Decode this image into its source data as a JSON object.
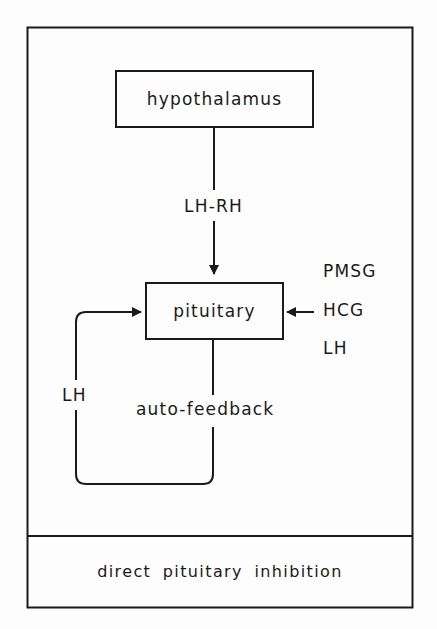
{
  "diagram": {
    "nodes": {
      "hypothalamus": {
        "label": "hypothalamus"
      },
      "pituitary": {
        "label": "pituitary"
      }
    },
    "edges": {
      "hypothalamus_to_pituitary": {
        "label": "LH-RH"
      },
      "auto_feedback": {
        "label": "auto-feedback"
      },
      "feedback_loop": {
        "label": "LH"
      }
    },
    "external_inputs": {
      "items": [
        {
          "label": "PMSG"
        },
        {
          "label": "HCG"
        },
        {
          "label": "LH"
        }
      ]
    },
    "footer": {
      "label": "direct pituitary inhibition"
    }
  },
  "colors": {
    "stroke": "#1a1a1a",
    "background": "#fdfdfd"
  }
}
